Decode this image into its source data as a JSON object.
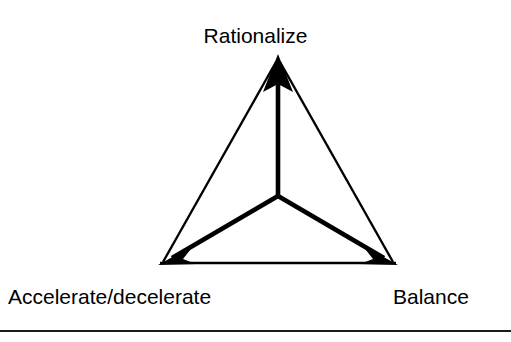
{
  "figure": {
    "type": "triangle-triad-diagram",
    "background_color": "#ffffff",
    "stroke_color": "#000000",
    "nodes": [
      {
        "id": "rationalize",
        "label": "Rationalize",
        "position": "top",
        "vertex": {
          "x": 278,
          "y": 55
        },
        "arrow_direction": "up"
      },
      {
        "id": "accelerate-decelerate",
        "label": "Accelerate/decelerate",
        "position": "bottom-left",
        "vertex": {
          "x": 160,
          "y": 264
        },
        "arrow_direction": "down-left"
      },
      {
        "id": "balance",
        "label": "Balance",
        "position": "bottom-right",
        "vertex": {
          "x": 396,
          "y": 264
        },
        "arrow_direction": "down-right"
      }
    ],
    "hub": {
      "x": 278,
      "y": 196
    },
    "spokes": [
      {
        "from": "hub",
        "to": "rationalize"
      },
      {
        "from": "hub",
        "to": "accelerate-decelerate"
      },
      {
        "from": "hub",
        "to": "balance"
      }
    ],
    "outline_edges": [
      {
        "from": "rationalize",
        "to": "accelerate-decelerate"
      },
      {
        "from": "accelerate-decelerate",
        "to": "balance"
      },
      {
        "from": "balance",
        "to": "rationalize"
      }
    ],
    "footer_rule": {
      "visible": true,
      "y": 330,
      "color": "#1a1a1a"
    }
  }
}
